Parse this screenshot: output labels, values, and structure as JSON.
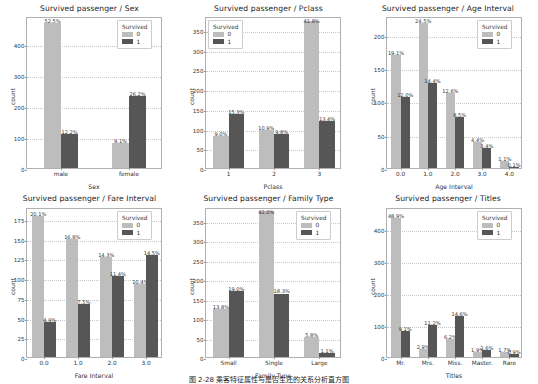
{
  "figure": {
    "caption": "图 2-28   乘客特征属性与是否生还的关系分析直方图",
    "legend_title": "Survived",
    "legend_items": [
      "0",
      "1"
    ],
    "color_survived_0": "#bdbdbd",
    "color_survived_1": "#565656"
  },
  "chart_data": [
    {
      "type": "bar",
      "title": "Survived passenger / Sex",
      "xlabel": "Sex",
      "ylabel": "count",
      "categories": [
        "male",
        "female"
      ],
      "yticks": [
        0,
        100,
        200,
        300,
        400
      ],
      "ylim": [
        0,
        490
      ],
      "grid": true,
      "legend": {
        "title": "Survived",
        "position": "upper right",
        "entries": [
          "0",
          "1"
        ]
      },
      "series": [
        {
          "name": "0",
          "values": [
            468,
            81
          ],
          "labels": [
            "52.5%",
            "9.1%"
          ]
        },
        {
          "name": "1",
          "values": [
            109,
            233
          ],
          "labels": [
            "12.2%",
            "26.2%"
          ]
        }
      ]
    },
    {
      "type": "bar",
      "title": "Survived passenger / Pclass",
      "xlabel": "Pclass",
      "ylabel": "count",
      "categories": [
        "1",
        "2",
        "3"
      ],
      "yticks": [
        0,
        50,
        100,
        150,
        200,
        250,
        300,
        350
      ],
      "ylim": [
        0,
        385
      ],
      "grid": true,
      "legend": {
        "title": "Survived",
        "position": "upper left",
        "entries": [
          "0",
          "1"
        ]
      },
      "series": [
        {
          "name": "0",
          "values": [
            80,
            97,
            372
          ],
          "labels": [
            "9.0%",
            "10.9%",
            "41.8%"
          ]
        },
        {
          "name": "1",
          "values": [
            136,
            87,
            119
          ],
          "labels": [
            "15.3%",
            "9.8%",
            "13.4%"
          ]
        }
      ]
    },
    {
      "type": "bar",
      "title": "Survived passenger / Age Interval",
      "xlabel": "Age Interval",
      "ylabel": "count",
      "categories": [
        "0.0",
        "1.0",
        "2.0",
        "3.0",
        "4.0"
      ],
      "yticks": [
        0,
        50,
        100,
        150,
        200
      ],
      "ylim": [
        0,
        228
      ],
      "grid": true,
      "legend": {
        "title": "Survived",
        "position": "upper right",
        "entries": [
          "0",
          "1"
        ]
      },
      "series": [
        {
          "name": "0",
          "values": [
            170,
            218,
            112,
            39,
            10
          ],
          "labels": [
            "19.1%",
            "24.5%",
            "12.6%",
            "4.4%",
            "1.1%"
          ]
        },
        {
          "name": "1",
          "values": [
            107,
            128,
            76,
            30,
            1
          ],
          "labels": [
            "12.0%",
            "14.4%",
            "8.5%",
            "3.4%",
            "0.1%"
          ]
        }
      ]
    },
    {
      "type": "bar",
      "title": "Survived passenger / Fare Interval",
      "xlabel": "Fare Interval",
      "ylabel": "count",
      "categories": [
        "0.0",
        "1.0",
        "2.0",
        "3.0"
      ],
      "yticks": [
        0,
        25,
        50,
        75,
        100,
        125,
        150,
        175
      ],
      "ylim": [
        0,
        190
      ],
      "grid": true,
      "legend": {
        "title": "Survived",
        "position": "upper right",
        "entries": [
          "0",
          "1"
        ]
      },
      "series": [
        {
          "name": "0",
          "values": [
            179,
            150,
            127,
            93
          ],
          "labels": [
            "20.1%",
            "16.8%",
            "14.3%",
            "10.4%"
          ]
        },
        {
          "name": "1",
          "values": [
            44,
            67,
            102,
            129
          ],
          "labels": [
            "4.9%",
            "7.5%",
            "11.4%",
            "14.5%"
          ]
        }
      ]
    },
    {
      "type": "bar",
      "title": "Survived passenger / Family Type",
      "xlabel": "Family Type",
      "ylabel": "count",
      "categories": [
        "Small",
        "Single",
        "Large"
      ],
      "yticks": [
        0,
        50,
        100,
        150,
        200,
        250,
        300,
        350
      ],
      "ylim": [
        0,
        385
      ],
      "grid": true,
      "legend": {
        "title": "Survived",
        "position": "upper right",
        "entries": [
          "0",
          "1"
        ]
      },
      "series": [
        {
          "name": "0",
          "values": [
            123,
            374,
            52
          ],
          "labels": [
            "13.8%",
            "42.0%",
            "5.8%"
          ]
        },
        {
          "name": "1",
          "values": [
            169,
            163,
            10
          ],
          "labels": [
            "19.0%",
            "18.3%",
            "1.1%"
          ]
        }
      ]
    },
    {
      "type": "bar",
      "title": "Survived passenger / Titles",
      "xlabel": "Titles",
      "ylabel": "count",
      "categories": [
        "Mr.",
        "Mrs.",
        "Miss.",
        "Master.",
        "Rare"
      ],
      "yticks": [
        0,
        100,
        200,
        300,
        400
      ],
      "ylim": [
        0,
        470
      ],
      "grid": true,
      "legend": {
        "title": "Survived",
        "position": "upper right",
        "entries": [
          "0",
          "1"
        ]
      },
      "series": [
        {
          "name": "0",
          "values": [
            436,
            26,
            55,
            17,
            15
          ],
          "labels": [
            "48.9%",
            "2.9%",
            "6.2%",
            "1.9%",
            "1.7%"
          ]
        },
        {
          "name": "1",
          "values": [
            81,
            100,
            130,
            23,
            8
          ],
          "labels": [
            "9.1%",
            "11.2%",
            "14.6%",
            "2.6%",
            "0.9%"
          ]
        }
      ]
    }
  ]
}
